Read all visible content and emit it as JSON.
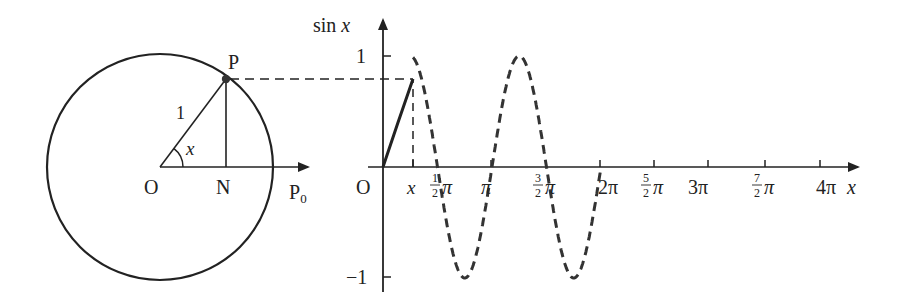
{
  "colors": {
    "stroke": "#222222",
    "background": "#ffffff"
  },
  "unit_circle": {
    "center_label": "O",
    "point_label": "P",
    "foot_label": "N",
    "start_label": "P",
    "start_subscript": "0",
    "radius_label": "1",
    "angle_label": "x"
  },
  "graph": {
    "y_axis_label": "sin x",
    "origin_label": "O",
    "x_axis_label": "x",
    "y_ticks": [
      {
        "label": "1",
        "value": 1
      },
      {
        "label": "−1",
        "value": -1
      }
    ],
    "x_marker_label": "x",
    "x_ticks": [
      {
        "num": "1",
        "den": "2",
        "suffix": "π",
        "value": 0.5
      },
      {
        "num": "",
        "den": "",
        "suffix": "π",
        "value": 1
      },
      {
        "num": "3",
        "den": "2",
        "suffix": "π",
        "value": 1.5
      },
      {
        "num": "",
        "den": "",
        "suffix": "2π",
        "value": 2
      },
      {
        "num": "5",
        "den": "2",
        "suffix": "π",
        "value": 2.5
      },
      {
        "num": "",
        "den": "",
        "suffix": "3π",
        "value": 3
      },
      {
        "num": "7",
        "den": "2",
        "suffix": "π",
        "value": 3.5
      },
      {
        "num": "",
        "den": "",
        "suffix": "4π",
        "value": 4
      }
    ]
  }
}
